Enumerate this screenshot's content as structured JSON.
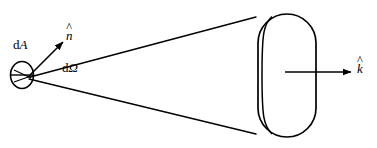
{
  "figure": {
    "type": "diagram",
    "width": 377,
    "height": 148,
    "background_color": "#ffffff",
    "stroke_color": "#000000"
  },
  "labels": {
    "area_element": {
      "prefix": "d",
      "symbol": "A",
      "text": "dA"
    },
    "normal_vector": {
      "symbol": "n",
      "accent": "^",
      "text": "n̂"
    },
    "solid_angle": {
      "prefix": "d",
      "symbol": "Ω",
      "text": "dΩ"
    },
    "wave_vector": {
      "symbol": "k",
      "accent": "^",
      "text": "k̂"
    }
  },
  "shapes": {
    "area_patch": {
      "name": "dA ellipse (area element seen edge-on)",
      "cx": 22,
      "cy": 75,
      "rx": 11,
      "ry": 13,
      "chord_y": 75
    },
    "solid_angle_cone": {
      "name": "cone of directions subtending dΩ",
      "apex": [
        30,
        77
      ],
      "top_edge_end": [
        256,
        17
      ],
      "bottom_edge_end": [
        256,
        134
      ]
    },
    "detector_stadium": {
      "name": "rounded-rectangle (stadium) detector face",
      "x": 258,
      "y": 14,
      "width": 58,
      "height": 123,
      "radius": 29
    },
    "back_edge_arc": {
      "name": "rear ellipse arc of the stadium",
      "x": 262,
      "y_top": 25,
      "y_bottom": 126
    },
    "normal_arrow": {
      "name": "n-hat arrow",
      "from": [
        28,
        77
      ],
      "to": [
        64,
        41
      ]
    },
    "propagation_arrow": {
      "name": "k-hat arrow",
      "from": [
        285,
        72
      ],
      "to": [
        352,
        72
      ]
    }
  }
}
